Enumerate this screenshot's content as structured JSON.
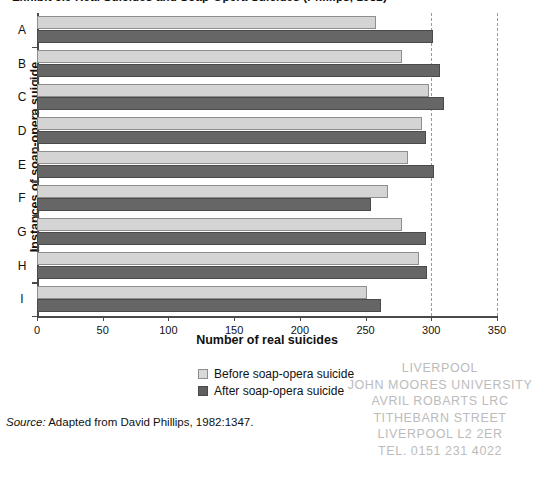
{
  "figure": {
    "title": "Exhibit 5.9   Real Suicides and Soap-Opera Suicides (Phillips, 1982)",
    "source_prefix": "Source:",
    "source_text": " Adapted from David Phillips, 1982:1347."
  },
  "legend": {
    "position": "below-plot-center",
    "items": [
      {
        "label": "Before soap-opera suicide",
        "color": "#d9d9d9",
        "swatch": "before"
      },
      {
        "label": "After soap-opera suicide",
        "color": "#5f5f5f",
        "swatch": "after"
      }
    ]
  },
  "stamp": {
    "lines": [
      "LIVERPOOL",
      "JOHN MOORES UNIVERSITY",
      "AVRIL ROBARTS LRC",
      "TITHEBARN STREET",
      "LIVERPOOL L2 2ER",
      "TEL. 0151 231 4022"
    ]
  },
  "chart_data": {
    "type": "bar",
    "orientation": "horizontal",
    "title": "Exhibit 5.9   Real Suicides and Soap-Opera Suicides (Phillips, 1982)",
    "xlabel": "Number of real suicides",
    "ylabel": "Instances of soap-opera suicide",
    "categories": [
      "A",
      "B",
      "C",
      "D",
      "E",
      "F",
      "G",
      "H",
      "I"
    ],
    "xlim": [
      0,
      350
    ],
    "xticks": [
      0,
      50,
      100,
      150,
      200,
      250,
      300,
      350
    ],
    "xticklabels": [
      "0",
      "50",
      "100",
      "150",
      "200",
      "250",
      "300",
      "350"
    ],
    "grid": "vertical-dashed-at-300-and-350",
    "legend": [
      "Before soap-opera suicide",
      "After soap-opera suicide"
    ],
    "series": [
      {
        "name": "Before soap-opera suicide",
        "color": "#d4d4d4",
        "values": [
          258,
          278,
          298,
          293,
          282,
          267,
          278,
          291,
          251
        ]
      },
      {
        "name": "After soap-opera suicide",
        "color": "#666666",
        "values": [
          301,
          307,
          310,
          296,
          302,
          254,
          296,
          297,
          262
        ]
      }
    ]
  }
}
